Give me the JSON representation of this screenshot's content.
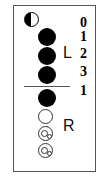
{
  "diagram": {
    "side_labels": {
      "left": "L",
      "right": "R"
    },
    "numbers": [
      "0",
      "1",
      "2",
      "3",
      "1"
    ],
    "circles": [
      {
        "type": "half-filled",
        "position": "top"
      },
      {
        "type": "filled",
        "group": "L",
        "count_label": "1"
      },
      {
        "type": "filled",
        "group": "L",
        "count_label": "2"
      },
      {
        "type": "filled",
        "group": "L",
        "count_label": "3"
      },
      {
        "type": "filled",
        "group": "R",
        "count_label": "1"
      },
      {
        "type": "empty",
        "group": "R"
      },
      {
        "type": "empty-with-small-circles",
        "group": "R"
      },
      {
        "type": "empty-with-small-circles",
        "group": "R"
      }
    ],
    "colors": {
      "fill": "#000000",
      "border": "#555555",
      "background": "#ffffff"
    }
  }
}
